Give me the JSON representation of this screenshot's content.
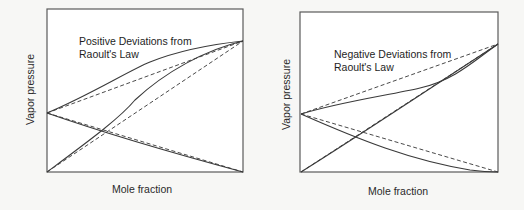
{
  "panels": [
    {
      "id": "positive",
      "title": "Positive Deviations from\nRaoult's Law",
      "xlabel": "Mole fraction",
      "ylabel": "Vapor pressure",
      "frame": {
        "x": 47,
        "y": 9,
        "w": 196,
        "h": 163
      },
      "ideal_lines": [
        "M47,113 L243,41",
        "M47,172 L243,41",
        "M47,113 L243,172"
      ],
      "real_curves": [
        "M47,113 C90,95 130,70 150,62 C180,50 215,44 243,41",
        "M47,172 C90,140 120,118 135,100 C165,72 205,50 243,41",
        "M47,113 C110,135 180,155 243,172"
      ]
    },
    {
      "id": "negative",
      "title": "Negative Deviations from\nRaoult's Law",
      "xlabel": "Mole fraction",
      "ylabel": "Vapor pressure",
      "frame": {
        "x": 300,
        "y": 12,
        "w": 198,
        "h": 160
      },
      "ideal_lines": [
        "M301,114 L498,44",
        "M301,172 L498,44",
        "M301,114 L498,172"
      ],
      "real_curves": [
        "M301,114 C340,102 390,95 420,88 C455,80 475,60 498,44",
        "M301,172 C360,135 420,95 498,44",
        "M301,114 C360,140 410,160 470,170 C485,172 492,172 498,172"
      ]
    }
  ],
  "colors": {
    "line": "#3a3a3a",
    "frame": "#5a5a5a",
    "background": "#f7f7f5"
  }
}
